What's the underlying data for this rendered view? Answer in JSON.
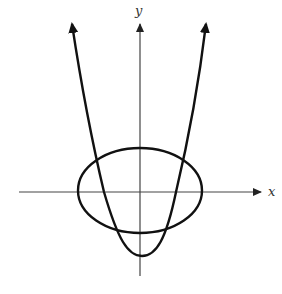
{
  "diagram": {
    "axes": {
      "x_label": "x",
      "y_label": "y"
    },
    "curves": [
      {
        "name": "parabola",
        "type": "parabola",
        "opens": "up",
        "arrows": "both ends"
      },
      {
        "name": "ellipse",
        "type": "ellipse",
        "centered_at": "origin"
      }
    ],
    "colors": {
      "stroke": "#111111",
      "axis": "#333333",
      "background": "#ffffff"
    }
  }
}
